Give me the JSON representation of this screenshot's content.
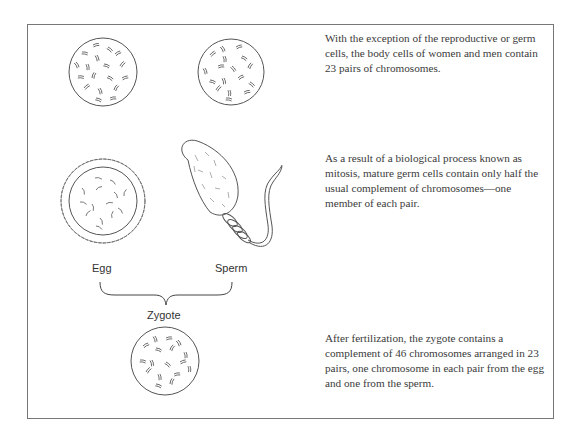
{
  "figure": {
    "paragraphs": [
      "With the exception of the reproductive or germ cells, the body cells of women and men contain 23 pairs of chromosomes.",
      "As a result of a biological process known as mitosis, mature germ cells contain only half the usual complement of chromosomes—one member of each pair.",
      "After fertilization, the zygote contains a complement of 46 chromosomes arranged in 23 pairs, one chromosome in each pair from the egg and one from the sperm."
    ],
    "labels": {
      "egg": "Egg",
      "sperm": "Sperm",
      "zygote": "Zygote"
    },
    "illustrations": [
      "body-cell-female-icon",
      "body-cell-male-icon",
      "egg-cell-icon",
      "sperm-cell-icon",
      "brace-icon",
      "zygote-cell-icon"
    ]
  }
}
